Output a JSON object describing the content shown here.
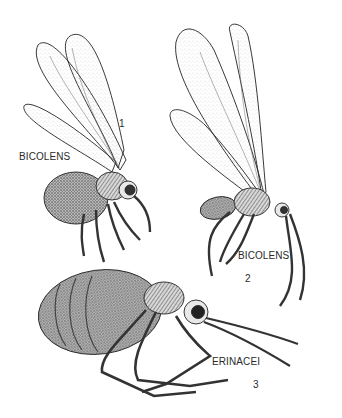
{
  "figure": {
    "specimens": [
      {
        "number": "1",
        "label": "BICOLENS"
      },
      {
        "number": "2",
        "label": "BICOLENS"
      },
      {
        "number": "3",
        "label": "ERINACEI"
      }
    ]
  }
}
